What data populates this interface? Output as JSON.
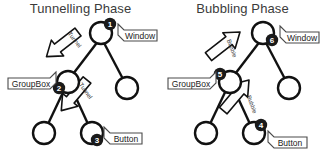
{
  "diagrams": [
    {
      "id": "tunnelling",
      "title": "Tunnelling Phase",
      "nodes": [
        {
          "id": "root",
          "label": "Window",
          "badge": "1"
        },
        {
          "id": "groupbox",
          "label": "GroupBox",
          "badge": "2"
        },
        {
          "id": "button",
          "label": "Button",
          "badge": "3"
        },
        {
          "id": "leaf_right",
          "label": "",
          "badge": ""
        },
        {
          "id": "leaf_left",
          "label": "",
          "badge": ""
        }
      ],
      "arrows": [
        {
          "id": "arrow-top",
          "label": "Tunnel",
          "direction": "down"
        },
        {
          "id": "arrow-bottom",
          "label": "Tunnel",
          "direction": "down"
        }
      ]
    },
    {
      "id": "bubbling",
      "title": "Bubbling Phase",
      "nodes": [
        {
          "id": "root",
          "label": "Window",
          "badge": "6"
        },
        {
          "id": "groupbox",
          "label": "GroupBox",
          "badge": "5"
        },
        {
          "id": "button",
          "label": "Button",
          "badge": "4"
        },
        {
          "id": "leaf_right",
          "label": "",
          "badge": ""
        },
        {
          "id": "leaf_left",
          "label": "",
          "badge": ""
        }
      ],
      "arrows": [
        {
          "id": "arrow-top",
          "label": "Bubble",
          "direction": "up"
        },
        {
          "id": "arrow-bottom",
          "label": "Bubble",
          "direction": "up"
        }
      ]
    }
  ],
  "colors": {
    "stroke": "#111111",
    "badge_fill": "#1a1a1a",
    "badge_text": "#ffffff",
    "title_text": "#3b3b3b",
    "node_fill": "#ffffff",
    "tag_fill": "#ffffff",
    "arrow_fill": "#fdfdfd"
  }
}
